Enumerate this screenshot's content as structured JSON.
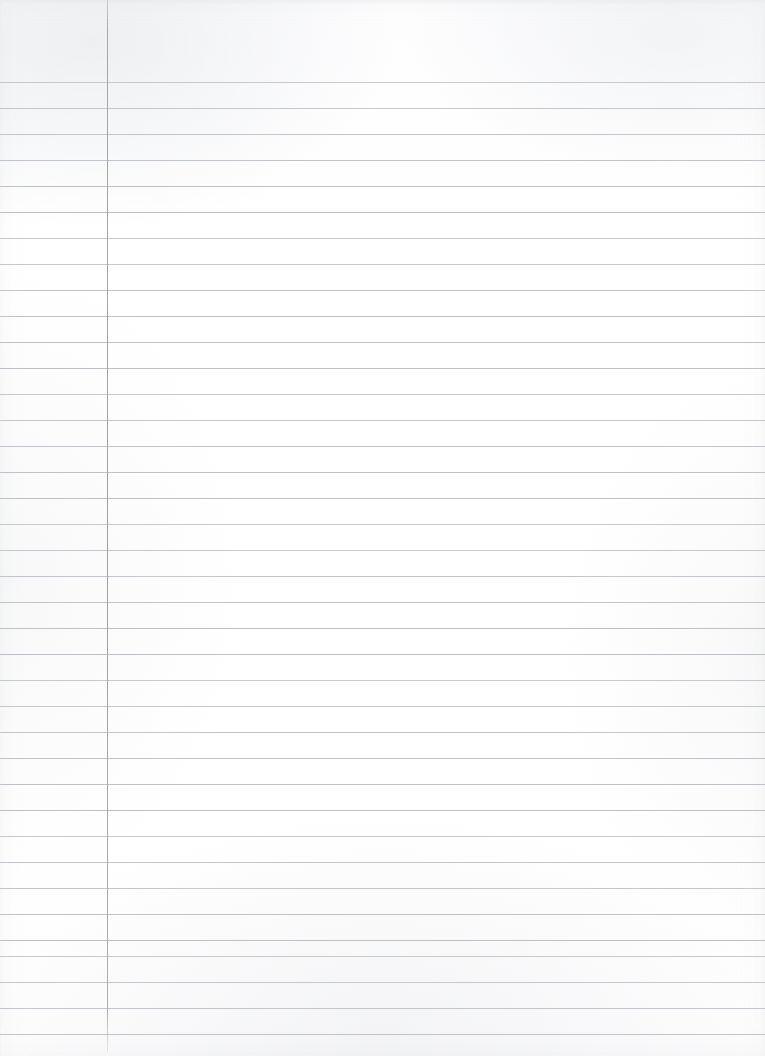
{
  "document": {
    "type": "lined-notebook-paper",
    "title": "Blank Ruled Paper Scan",
    "content_text": "",
    "is_blank": true,
    "page_width": 765,
    "page_height": 1056,
    "background_color": "#ffffff"
  },
  "ruling": {
    "style": "college-ruled",
    "line_color": "#b9bdc2",
    "line_thickness": 1,
    "line_spacing": 26,
    "first_line_y": 82,
    "line_count": 38,
    "line_start_x": 0,
    "line_end_x": 765,
    "horizontal_line_positions": [
      82,
      108,
      134,
      160,
      186,
      212,
      238,
      264,
      290,
      316,
      342,
      368,
      394,
      420,
      446,
      472,
      498,
      524,
      550,
      576,
      602,
      628,
      654,
      680,
      706,
      732,
      758,
      784,
      810,
      836,
      862,
      888,
      914,
      940,
      956,
      982,
      1008,
      1034
    ]
  },
  "margin_rule": {
    "label": "vertical-margin-line",
    "color": "#a0a4aa",
    "thickness": 1,
    "x": 107,
    "top_y": 0,
    "bottom_y": 1052,
    "length": 1052
  },
  "texture": {
    "description": "faint scanner mottling and paper grain",
    "highlight_color": "#ffffff",
    "shadow_color": "#e6e7ea"
  }
}
